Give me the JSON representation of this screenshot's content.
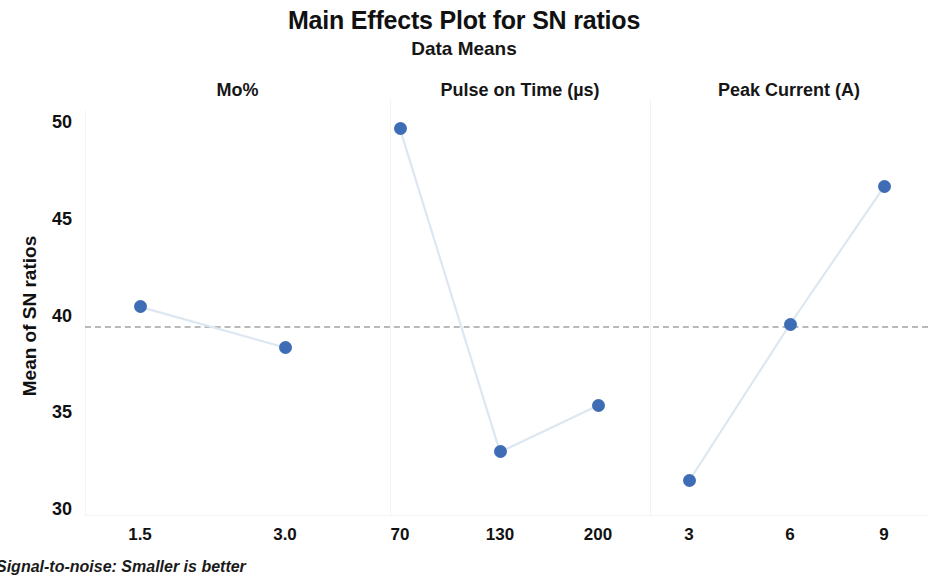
{
  "chart_data": {
    "type": "line",
    "title": "Main Effects Plot for SN ratios",
    "subtitle": "Data Means",
    "ylabel": "Mean of SN ratios",
    "xlabel": "",
    "ylim": [
      30,
      50
    ],
    "yticks": [
      30,
      35,
      40,
      45,
      50
    ],
    "grid": false,
    "legend": null,
    "reference_line": 39.5,
    "footnote": "Signal-to-noise: Smaller is better",
    "panels": [
      {
        "name": "Mo%",
        "categories": [
          "1.5",
          "3.0"
        ],
        "values": [
          40.5,
          38.4
        ]
      },
      {
        "name": "Pulse on Time (µs)",
        "categories": [
          "70",
          "130",
          "200"
        ],
        "values": [
          49.7,
          33.0,
          35.4
        ]
      },
      {
        "name": "Peak Current (A)",
        "categories": [
          "3",
          "6",
          "9"
        ],
        "values": [
          31.5,
          39.6,
          46.7
        ]
      }
    ],
    "colors": {
      "marker": "#3e6db5",
      "line": "#dde7f2",
      "reference_line": "#b9b9b9",
      "text": "#111111"
    }
  }
}
